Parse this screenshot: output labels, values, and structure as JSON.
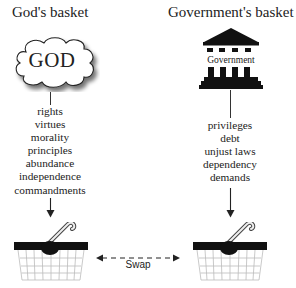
{
  "left": {
    "title": "God's basket",
    "icon_label": "GOD",
    "items": [
      "rights",
      "virtues",
      "morality",
      "principles",
      "abundance",
      "independence",
      "commandments"
    ]
  },
  "right": {
    "title": "Government's basket",
    "icon_label": "Government",
    "items": [
      "privileges",
      "debt",
      "unjust laws",
      "dependency",
      "demands"
    ]
  },
  "connector": {
    "label": "Swap"
  },
  "colors": {
    "ink": "#111111",
    "text": "#222222",
    "basket_wire": "#c8c8c8",
    "background": "#ffffff"
  }
}
